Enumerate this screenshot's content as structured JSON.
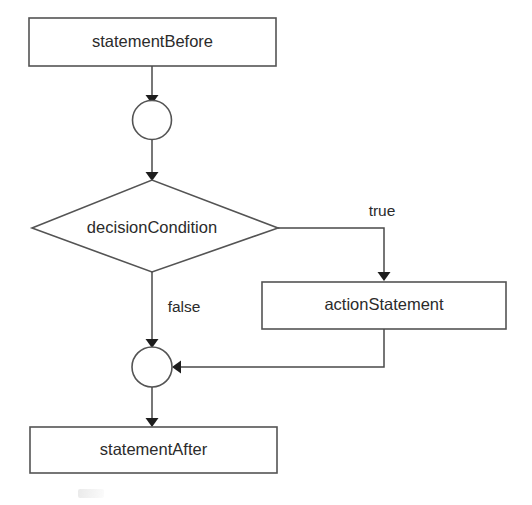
{
  "diagram": {
    "type": "flowchart",
    "colors": {
      "background": "#ffffff",
      "shape_stroke": "#545454",
      "line_stroke": "#4a4a4a",
      "arrow_fill": "#1d1d1d",
      "text": "#2b2b2b"
    },
    "nodes": [
      {
        "id": "statement-before",
        "shape": "rectangle",
        "label": "statementBefore",
        "x": 29,
        "y": 18,
        "width": 247,
        "height": 48,
        "cx": 152.5,
        "cy": 42
      },
      {
        "id": "merge-node-top",
        "shape": "circle",
        "label": "",
        "cx": 152,
        "cy": 120,
        "r": 19.5
      },
      {
        "id": "decision-condition",
        "shape": "diamond",
        "label": "decisionCondition",
        "cx": 152,
        "cy": 228,
        "left": 32,
        "right": 278,
        "top": 180,
        "bottom": 272
      },
      {
        "id": "action-statement",
        "shape": "rectangle",
        "label": "actionStatement",
        "x": 262,
        "y": 282,
        "width": 244,
        "height": 47,
        "cx": 384,
        "cy": 305.5
      },
      {
        "id": "merge-node-bottom",
        "shape": "circle",
        "label": "",
        "cx": 152,
        "cy": 367,
        "r": 20
      },
      {
        "id": "statement-after",
        "shape": "rectangle",
        "label": "statementAfter",
        "x": 30,
        "y": 427,
        "width": 247,
        "height": 46,
        "cx": 153.5,
        "cy": 450
      }
    ],
    "edges": [
      {
        "id": "edge-before-to-merge-top",
        "from": "statement-before",
        "to": "merge-node-top",
        "label": "",
        "path": "M152,66 L152,99",
        "arrow": {
          "x": 152,
          "y": 101,
          "dir": "down"
        }
      },
      {
        "id": "edge-merge-top-to-decision",
        "from": "merge-node-top",
        "to": "decision-condition",
        "label": "",
        "path": "M152,139.5 L152,178",
        "arrow": {
          "x": 152,
          "y": 180,
          "dir": "down"
        }
      },
      {
        "id": "edge-decision-true",
        "from": "decision-condition",
        "to": "action-statement",
        "label": "true",
        "label_x": 382,
        "label_y": 212,
        "path": "M278,228 L384,228 L384,279",
        "arrow": {
          "x": 384,
          "y": 281,
          "dir": "down"
        }
      },
      {
        "id": "edge-decision-false",
        "from": "decision-condition",
        "to": "merge-node-bottom",
        "label": "false",
        "label_x": 184,
        "label_y": 308,
        "path": "M152,272 L152,345",
        "arrow": {
          "x": 152,
          "y": 347,
          "dir": "down"
        }
      },
      {
        "id": "edge-action-to-merge-bottom",
        "from": "action-statement",
        "to": "merge-node-bottom",
        "label": "",
        "path": "M384,329 L384,367 L175,367",
        "arrow": {
          "x": 173,
          "y": 367,
          "dir": "left"
        }
      },
      {
        "id": "edge-merge-bottom-to-after",
        "from": "merge-node-bottom",
        "to": "statement-after",
        "label": "",
        "path": "M152,387 L152,424",
        "arrow": {
          "x": 152,
          "y": 426,
          "dir": "down"
        }
      }
    ]
  }
}
